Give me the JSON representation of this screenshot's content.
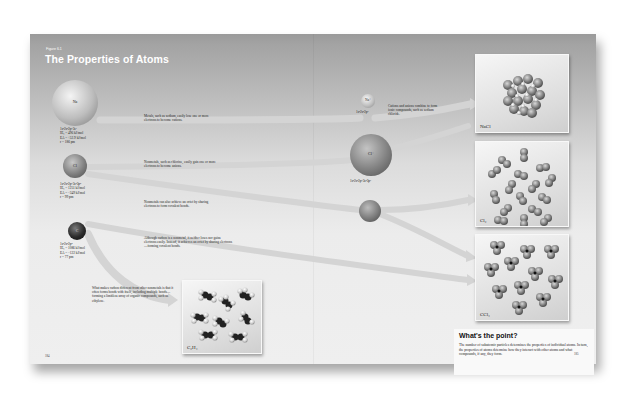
{
  "figure": {
    "label": "Figure 6.1",
    "title": "The Properties of Atoms"
  },
  "atoms": [
    {
      "symbol": "Na",
      "configuration": "1s²2s²2p⁶3s¹",
      "ionization_energy": "IE₁ = 496 kJ/mol",
      "electron_affinity": "EA = +52.9 kJ/mol",
      "radius": "r = 186 pm",
      "color": "#b8b8b8"
    },
    {
      "symbol": "Cl",
      "configuration": "1s²2s²2p⁶3s²3p⁵",
      "ionization_energy": "IE₁ = 1251 kJ/mol",
      "electron_affinity": "EA = −349 kJ/mol",
      "radius": "r = 99 pm",
      "color": "#7a7a7a"
    },
    {
      "symbol": "C",
      "configuration": "1s²2s²2p²",
      "ionization_energy": "IE₁ = 1086 kJ/mol",
      "electron_affinity": "EA = −122 kJ/mol",
      "radius": "r = 77 pm",
      "color": "#2a2a2a"
    }
  ],
  "ions": [
    {
      "symbol": "Na⁺",
      "configuration": "1s²2s²2p⁶"
    },
    {
      "symbol": "Cl⁻",
      "configuration": "1s²2s²2p⁶3s²3p⁶"
    }
  ],
  "captions": {
    "metals": "Metals, such as sodium, easily lose one or more electrons to become cations.",
    "nonmetals_anions": "Nonmetals, such as chlorine, easily gain one or more electrons to become anions.",
    "nonmetals_covalent": "Nonmetals can also achieve an octet by sharing electrons to form covalent bonds.",
    "carbon": "Although carbon is a nonmetal, it neither loses nor gains electrons easily. Instead, it achieves an octet by sharing electrons—forming covalent bonds.",
    "ionic_compounds": "Cations and anions combine to form ionic compounds, such as sodium chloride.",
    "carbon_bonding": "What makes carbon different from other nonmetals is that it often forms bonds with itself, including multiple bonds—forming a limitless array of organic compounds, such as ethylene."
  },
  "panels": [
    {
      "label": "NaCl"
    },
    {
      "label": "Cl₂"
    },
    {
      "label": "CCl₄"
    },
    {
      "label": "C₂H₄"
    }
  ],
  "whats_the_point": {
    "title": "What's the point?",
    "body": "The number of subatomic particles determines the properties of individual atoms. In turn, the properties of atoms determine how they interact with other atoms and what compounds, if any, they form."
  },
  "page_numbers": {
    "left": "184",
    "right": "185"
  },
  "colors": {
    "header_band": "#9a9a9a",
    "page": "#ececec",
    "arrow": "#d2d2d2"
  }
}
